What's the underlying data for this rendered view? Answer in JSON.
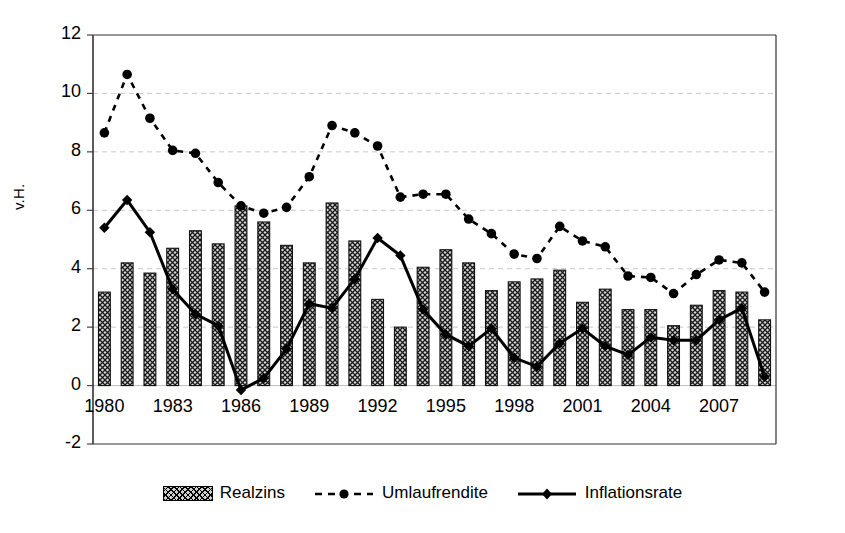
{
  "chart_data": {
    "type": "bar",
    "title": "",
    "xlabel": "",
    "ylabel": "v.H.",
    "ylim": [
      -2,
      12
    ],
    "ytick_values": [
      -2,
      0,
      2,
      4,
      6,
      8,
      10,
      12
    ],
    "ytick_labels": [
      "-2",
      "0",
      "2",
      "4",
      "6",
      "8",
      "10",
      "12"
    ],
    "grid": "horizontal-dashed",
    "legend_position": "bottom-center",
    "x": [
      1980,
      1981,
      1982,
      1983,
      1984,
      1985,
      1986,
      1987,
      1988,
      1989,
      1990,
      1991,
      1992,
      1993,
      1994,
      1995,
      1996,
      1997,
      1998,
      1999,
      2000,
      2001,
      2002,
      2003,
      2004,
      2005,
      2006,
      2007,
      2008,
      2009
    ],
    "xtick_labels": [
      "1980",
      "1983",
      "1986",
      "1989",
      "1992",
      "1995",
      "1998",
      "2001",
      "2004",
      "2007"
    ],
    "xtick_values": [
      1980,
      1983,
      1986,
      1989,
      1992,
      1995,
      1998,
      2001,
      2004,
      2007
    ],
    "series": [
      {
        "name": "Realzins",
        "type": "bar",
        "values": [
          3.2,
          4.2,
          3.85,
          4.7,
          5.3,
          4.85,
          6.15,
          5.6,
          4.8,
          4.2,
          6.25,
          4.95,
          2.95,
          2.0,
          4.05,
          4.65,
          4.2,
          3.25,
          3.55,
          3.65,
          3.95,
          2.85,
          3.3,
          2.6,
          2.6,
          2.05,
          2.75,
          3.25,
          3.2,
          2.25
        ]
      },
      {
        "name": "Umlaufrendite",
        "type": "line-dashed-circle",
        "values": [
          8.65,
          10.65,
          9.15,
          8.05,
          7.95,
          6.95,
          6.15,
          5.9,
          6.1,
          7.15,
          8.9,
          8.65,
          8.2,
          6.45,
          6.55,
          6.55,
          5.7,
          5.2,
          4.5,
          4.35,
          5.45,
          4.95,
          4.75,
          3.75,
          3.7,
          3.15,
          3.8,
          4.3,
          4.2,
          3.2
        ]
      },
      {
        "name": "Inflationsrate",
        "type": "line-solid-diamond",
        "values": [
          5.4,
          6.35,
          5.25,
          3.3,
          2.45,
          2.05,
          -0.15,
          0.25,
          1.25,
          2.8,
          2.65,
          3.65,
          5.05,
          4.45,
          2.6,
          1.75,
          1.35,
          1.95,
          0.95,
          0.65,
          1.45,
          1.95,
          1.35,
          1.05,
          1.65,
          1.55,
          1.55,
          2.25,
          2.65,
          0.3
        ]
      }
    ]
  },
  "axis": {
    "y_title": "v.H."
  },
  "legend": {
    "items": [
      {
        "label": "Realzins",
        "marker": "bar-hatched"
      },
      {
        "label": "Umlaufrendite",
        "marker": "dashed-circle"
      },
      {
        "label": "Inflationsrate",
        "marker": "solid-diamond"
      }
    ]
  }
}
